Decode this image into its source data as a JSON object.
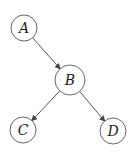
{
  "diagram": {
    "type": "directed-graph",
    "nodes": [
      {
        "id": "A",
        "label": "A",
        "cx": 24,
        "cy": 28,
        "r": 13
      },
      {
        "id": "B",
        "label": "B",
        "cx": 70,
        "cy": 80,
        "r": 15
      },
      {
        "id": "C",
        "label": "C",
        "cx": 23,
        "cy": 130,
        "r": 13
      },
      {
        "id": "D",
        "label": "D",
        "cx": 113,
        "cy": 131,
        "r": 13
      }
    ],
    "edges": [
      {
        "from": "A",
        "to": "B"
      },
      {
        "from": "B",
        "to": "C"
      },
      {
        "from": "B",
        "to": "D"
      }
    ],
    "colors": {
      "stroke": "#555555",
      "edge": "#444444",
      "text": "#222222",
      "background": "#ffffff"
    }
  }
}
